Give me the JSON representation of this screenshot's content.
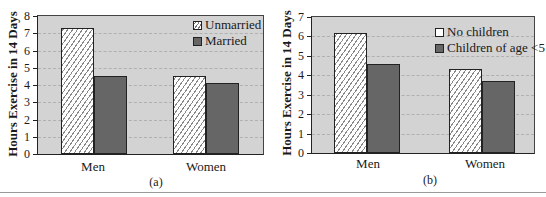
{
  "chart_data": [
    {
      "type": "bar",
      "panel": "(a)",
      "categories": [
        "Men",
        "Women"
      ],
      "series": [
        {
          "name": "Unmarried",
          "values": [
            7.3,
            4.5
          ],
          "pattern": "hatched"
        },
        {
          "name": "Married",
          "values": [
            4.5,
            4.1
          ],
          "pattern": "solid"
        }
      ],
      "title": "",
      "xlabel": "",
      "ylabel": "Hours Exercise in 14 Days",
      "ylim": [
        0,
        8
      ],
      "yticks": [
        0,
        1,
        2,
        3,
        4,
        5,
        6,
        7,
        8
      ],
      "grid": "horizontal dashed",
      "legend_position": "upper right"
    },
    {
      "type": "bar",
      "panel": "(b)",
      "categories": [
        "Men",
        "Women"
      ],
      "series": [
        {
          "name": "No children",
          "values": [
            6.2,
            4.3
          ],
          "pattern": "hatched"
        },
        {
          "name": "Children of age <5",
          "values": [
            4.6,
            3.7
          ],
          "pattern": "solid"
        }
      ],
      "title": "",
      "xlabel": "",
      "ylabel": "Hours Exercise in 14 Days",
      "ylim": [
        0,
        7
      ],
      "yticks": [
        0,
        1,
        2,
        3,
        4,
        5,
        6,
        7
      ],
      "grid": "horizontal dashed",
      "legend_position": "upper right"
    }
  ],
  "panels": {
    "a": {
      "caption": "(a)",
      "ylabel": "Hours Exercise in 14 Days",
      "categories": [
        "Men",
        "Women"
      ],
      "legend": [
        "Unmarried",
        "Married"
      ],
      "ticks": [
        "0",
        "1",
        "2",
        "3",
        "4",
        "5",
        "6",
        "7",
        "8"
      ]
    },
    "b": {
      "caption": "(b)",
      "ylabel": "Hours Exercise in 14 Days",
      "categories": [
        "Men",
        "Women"
      ],
      "legend": [
        "No children",
        "Children of age <5"
      ],
      "ticks": [
        "0",
        "1",
        "2",
        "3",
        "4",
        "5",
        "6",
        "7"
      ]
    }
  },
  "colors": {
    "plot_background": "#d3d3d3",
    "solid_bar": "#666666",
    "hatched_bar": "#ffffff"
  }
}
